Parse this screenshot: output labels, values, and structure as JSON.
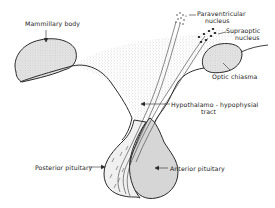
{
  "diagram": {
    "type": "anatomical",
    "colors": {
      "outline": "#2a2a2a",
      "fill_gland": "#d9d9d9",
      "fill_hypothalamus_stipple": "#e8e8e8",
      "background": "#ffffff"
    },
    "labels": {
      "mammillary_body": "Mammillary body",
      "paraventricular_1": "Paraventricular",
      "paraventricular_2": "nucleus",
      "supraoptic_1": "Supraoptic",
      "supraoptic_2": "nucleus",
      "optic_chiasma": "Optic  chiasma",
      "tract_1": "Hypothalamo - hypophysial",
      "tract_2": "tract",
      "posterior_pituitary": "Posterior pituitary",
      "anterior_pituitary": "Anterior pituitary"
    },
    "structures": [
      "mammillary-body",
      "paraventricular-nucleus",
      "supraoptic-nucleus",
      "optic-chiasma",
      "hypothalamo-hypophysial-tract",
      "posterior-pituitary",
      "anterior-pituitary",
      "infundibular-stalk"
    ]
  }
}
